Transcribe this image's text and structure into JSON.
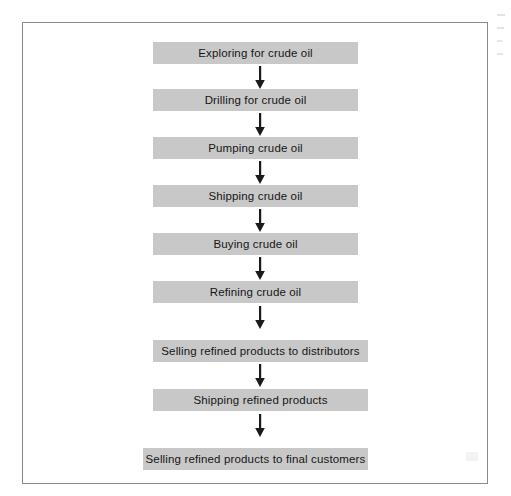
{
  "diagram": {
    "type": "flowchart",
    "orientation": "vertical",
    "node_fill_color": "#c8c8c8",
    "node_text_color": "#161616",
    "frame_border_color": "#8a8a8a",
    "background_color": "#ffffff",
    "connector_color": "#1a1a1a",
    "connector_label": "downward arrow",
    "node_count": 9,
    "connector_count": 8,
    "nodes": [
      {
        "label": "Exploring for crude oil",
        "left": 153,
        "top": 42,
        "width": 205
      },
      {
        "label": "Drilling for crude oil",
        "left": 153,
        "top": 89,
        "width": 205
      },
      {
        "label": "Pumping crude oil",
        "left": 153,
        "top": 137,
        "width": 205
      },
      {
        "label": "Shipping crude oil",
        "left": 153,
        "top": 185,
        "width": 205
      },
      {
        "label": "Buying crude oil",
        "left": 153,
        "top": 233,
        "width": 205
      },
      {
        "label": "Refining crude oil",
        "left": 153,
        "top": 281,
        "width": 205
      },
      {
        "label": "Selling refined products to distributors",
        "left": 153,
        "top": 340,
        "width": 215
      },
      {
        "label": "Shipping refined products",
        "left": 153,
        "top": 389,
        "width": 215
      },
      {
        "label": "Selling refined products to final customers",
        "left": 143,
        "top": 448,
        "width": 225
      }
    ],
    "connectors": [
      {
        "from": "Exploring for crude oil",
        "to": "Drilling for crude oil",
        "left": 253,
        "top": 66
      },
      {
        "from": "Drilling for crude oil",
        "to": "Pumping crude oil",
        "left": 253,
        "top": 113
      },
      {
        "from": "Pumping crude oil",
        "to": "Shipping crude oil",
        "left": 253,
        "top": 161
      },
      {
        "from": "Shipping crude oil",
        "to": "Buying crude oil",
        "left": 253,
        "top": 209
      },
      {
        "from": "Buying crude oil",
        "to": "Refining crude oil",
        "left": 253,
        "top": 257
      },
      {
        "from": "Refining crude oil",
        "to": "Selling refined products to distributors",
        "left": 253,
        "top": 306
      },
      {
        "from": "Selling refined products to distributors",
        "to": "Shipping refined products",
        "left": 253,
        "top": 364
      },
      {
        "from": "Shipping refined products",
        "to": "Selling refined products to final customers",
        "left": 253,
        "top": 414
      }
    ]
  }
}
